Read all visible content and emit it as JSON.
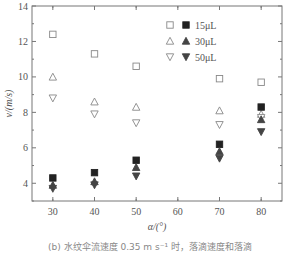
{
  "chart_data": {
    "type": "scatter",
    "title": "",
    "xlabel": "α/(°)",
    "ylabel": "v/(m/s)",
    "xlim": [
      25,
      85
    ],
    "ylim": [
      3,
      14
    ],
    "xticks": [
      30,
      40,
      50,
      60,
      70,
      80
    ],
    "yticks": [
      4,
      6,
      8,
      10,
      12,
      14
    ],
    "grid": false,
    "legend_position": "upper right",
    "x": [
      30,
      40,
      50,
      70,
      80
    ],
    "series": [
      {
        "name": "15μL (open)",
        "marker": "square-open",
        "values": [
          12.4,
          11.3,
          10.6,
          9.9,
          9.7
        ]
      },
      {
        "name": "30μL (open)",
        "marker": "triangle-up-open",
        "values": [
          10.0,
          8.6,
          8.3,
          8.1,
          7.9
        ]
      },
      {
        "name": "50μL (open)",
        "marker": "triangle-down-open",
        "values": [
          8.8,
          7.9,
          7.4,
          7.3,
          7.7
        ]
      },
      {
        "name": "15μL (filled)",
        "marker": "square-filled",
        "values": [
          4.3,
          4.6,
          5.3,
          6.2,
          8.3
        ]
      },
      {
        "name": "30μL (filled)",
        "marker": "triangle-up-filled",
        "values": [
          3.9,
          4.1,
          4.9,
          5.8,
          7.6
        ]
      },
      {
        "name": "50μL (filled)",
        "marker": "triangle-down-filled",
        "values": [
          3.7,
          3.9,
          4.4,
          5.4,
          6.9
        ]
      }
    ],
    "legend": [
      {
        "label": "15μL",
        "markers": [
          "square-open",
          "square-filled"
        ]
      },
      {
        "label": "30μL",
        "markers": [
          "triangle-up-open",
          "triangle-up-filled"
        ]
      },
      {
        "label": "50μL",
        "markers": [
          "triangle-down-open",
          "triangle-down-filled"
        ]
      }
    ]
  },
  "caption": "(b) 水纹伞流速度 0.35 m s⁻¹ 时，落滴速度和落滴"
}
